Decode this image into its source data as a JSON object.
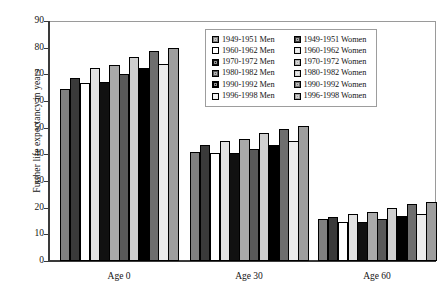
{
  "chart_data": {
    "type": "bar",
    "title": "",
    "subtitle": "",
    "xlabel": "",
    "ylabel": "Further life expectancy in years",
    "categories": [
      "Age 0",
      "Age 30",
      "Age 60"
    ],
    "ylim": [
      0,
      90
    ],
    "ytick_step": 10,
    "yticks": [
      90,
      80,
      70,
      60,
      50,
      40,
      30,
      20,
      10,
      0
    ],
    "grid": false,
    "legend_position": "inside top-right",
    "legend_columns": 2,
    "legend_column_titles": [
      "Men",
      "Women"
    ],
    "series": [
      {
        "name": "1949-1951 Men",
        "period": "1949-1951",
        "sex": "Men",
        "color": "#808080",
        "values": [
          64.6,
          40.9,
          15.6
        ]
      },
      {
        "name": "1949-1951 Women",
        "period": "1949-1951",
        "sex": "Women",
        "color": "#3a3a3a",
        "values": [
          68.5,
          43.4,
          16.6
        ]
      },
      {
        "name": "1960-1962 Men",
        "period": "1960-1962",
        "sex": "Men",
        "color": "#ffffff",
        "values": [
          66.9,
          40.4,
          14.8
        ]
      },
      {
        "name": "1960-1962 Women",
        "period": "1960-1962",
        "sex": "Women",
        "color": "#e2e2e2",
        "values": [
          72.2,
          44.9,
          17.8
        ]
      },
      {
        "name": "1970-1972 Men",
        "period": "1970-1972",
        "sex": "Men",
        "color": "#111111",
        "values": [
          67.3,
          40.5,
          14.5
        ]
      },
      {
        "name": "1970-1972 Women",
        "period": "1970-1972",
        "sex": "Women",
        "color": "#a9a9a9",
        "values": [
          73.6,
          45.8,
          18.3
        ]
      },
      {
        "name": "1980-1982 Men",
        "period": "1980-1982",
        "sex": "Men",
        "color": "#595959",
        "values": [
          70.0,
          42.0,
          15.7
        ]
      },
      {
        "name": "1980-1982 Women",
        "period": "1980-1982",
        "sex": "Women",
        "color": "#cfcfcf",
        "values": [
          76.5,
          47.9,
          19.9
        ]
      },
      {
        "name": "1990-1992 Men",
        "period": "1990-1992",
        "sex": "Men",
        "color": "#000000",
        "values": [
          72.5,
          43.6,
          17.0
        ]
      },
      {
        "name": "1990-1992 Women",
        "period": "1990-1992",
        "sex": "Women",
        "color": "#6e6e6e",
        "values": [
          78.9,
          49.5,
          21.2
        ]
      },
      {
        "name": "1996-1998 Men",
        "period": "1996-1998",
        "sex": "Men",
        "color": "#ededed",
        "values": [
          74.0,
          45.0,
          17.8
        ]
      },
      {
        "name": "1996-1998 Women",
        "period": "1996-1998",
        "sex": "Women",
        "color": "#9e9e9e",
        "values": [
          80.0,
          50.5,
          22.2
        ]
      }
    ]
  },
  "axis": {
    "y_title": "Further life expectancy in years",
    "y_tick_labels": [
      "90",
      "80",
      "70",
      "60",
      "50",
      "40",
      "30",
      "20",
      "10",
      "0"
    ],
    "x_tick_labels": [
      "Age 0",
      "Age 30",
      "Age 60"
    ]
  },
  "legend": {
    "men": [
      {
        "label": "1949-1951 Men",
        "color": "#808080"
      },
      {
        "label": "1960-1962 Men",
        "color": "#ffffff"
      },
      {
        "label": "1970-1972 Men",
        "color": "#111111"
      },
      {
        "label": "1980-1982 Men",
        "color": "#595959"
      },
      {
        "label": "1990-1992 Men",
        "color": "#000000"
      },
      {
        "label": "1996-1998 Men",
        "color": "#ededed"
      }
    ],
    "women": [
      {
        "label": "1949-1951 Women",
        "color": "#3a3a3a"
      },
      {
        "label": "1960-1962 Women",
        "color": "#e2e2e2"
      },
      {
        "label": "1970-1972 Women",
        "color": "#a9a9a9"
      },
      {
        "label": "1980-1982 Women",
        "color": "#cfcfcf"
      },
      {
        "label": "1990-1992 Women",
        "color": "#6e6e6e"
      },
      {
        "label": "1996-1998 Women",
        "color": "#9e9e9e"
      }
    ]
  },
  "style": {
    "axis_color": "#3a3a3a",
    "frame_color": "#9a9a9a",
    "bar_outline": "#000000",
    "background": "#ffffff",
    "text_color": "#141414"
  }
}
